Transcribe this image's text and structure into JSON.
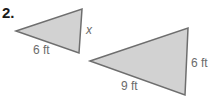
{
  "problem": {
    "number": "2."
  },
  "colors": {
    "fill": "#d2d2d2",
    "stroke": "#6e6e6e",
    "label": "#6b6b6b",
    "number": "#1a1a1a"
  },
  "triangles": [
    {
      "name": "small-triangle",
      "points": "16,31 82,9 79,53",
      "labels": {
        "bottom_side": "6 ft",
        "right_side": "x"
      }
    },
    {
      "name": "large-triangle",
      "points": "90,61 188,28 185,95",
      "labels": {
        "bottom_side": "9 ft",
        "right_side": "6 ft"
      }
    }
  ]
}
